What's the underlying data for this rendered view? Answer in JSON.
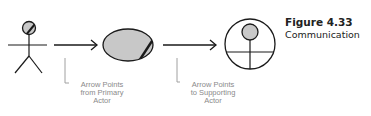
{
  "figure": {
    "number": "Figure 4.33",
    "title": "Communication"
  },
  "elements": {
    "primary_actor": {
      "icon": "stick-figure-actor-icon"
    },
    "use_case": {
      "icon": "use-case-ellipse-icon"
    },
    "supporting_actor": {
      "icon": "supporting-actor-circle-icon"
    }
  },
  "arrows": [
    {
      "from": "primary_actor",
      "to": "use_case"
    },
    {
      "from": "use_case",
      "to": "supporting_actor"
    }
  ],
  "callouts": [
    {
      "lines": [
        "Arrow Points",
        "from Primary",
        "Actor"
      ]
    },
    {
      "lines": [
        "Arrow Points",
        "to Supporting",
        "Actor"
      ]
    }
  ],
  "colors": {
    "stroke": "#1a1a1a",
    "fill": "#c8c8c8",
    "callout_line": "#a0a0a0",
    "callout_text": "#8a8a8a",
    "caption_text": "#222222"
  }
}
